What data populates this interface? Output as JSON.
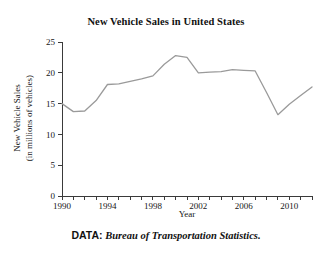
{
  "figure": {
    "title": "New Vehicle Sales in United States",
    "source_label": "DATA:",
    "source_value": "Bureau of Transportation Statistics."
  },
  "chart_data": {
    "type": "line",
    "title": "New Vehicle Sales in United States",
    "xlabel": "Year",
    "ylabel": "New Vehicle Sales (in millions of vehicles)",
    "ylabel_line1": "New Vehicle Sales",
    "ylabel_line2": "(in millions of vehicles)",
    "xlim": [
      1990,
      2012
    ],
    "ylim": [
      0,
      25
    ],
    "grid": false,
    "legend": "none",
    "line_color": "#9a9a9a",
    "axis_color": "#3a3a3a",
    "x_tick_labels": [
      "1990",
      "1994",
      "1998",
      "2002",
      "2006",
      "2010"
    ],
    "x_tick_label_values": [
      1990,
      1994,
      1998,
      2002,
      2006,
      2010
    ],
    "x_minor_ticks": [
      1990,
      1991,
      1992,
      1993,
      1994,
      1995,
      1996,
      1997,
      1998,
      1999,
      2000,
      2001,
      2002,
      2003,
      2004,
      2005,
      2006,
      2007,
      2008,
      2009,
      2010,
      2011,
      2012
    ],
    "y_tick_labels": [
      "0",
      "5",
      "10",
      "15",
      "20",
      "25"
    ],
    "y_tick_values": [
      0,
      5,
      10,
      15,
      20,
      25
    ],
    "x": [
      1990,
      1991,
      1992,
      1993,
      1994,
      1995,
      1996,
      1997,
      1998,
      1999,
      2000,
      2001,
      2002,
      2003,
      2004,
      2005,
      2006,
      2007,
      2008,
      2009,
      2010,
      2011,
      2012
    ],
    "values": [
      15.0,
      13.7,
      13.8,
      15.5,
      18.1,
      18.2,
      18.6,
      19.0,
      19.5,
      21.4,
      22.8,
      22.5,
      20.0,
      20.1,
      20.2,
      20.5,
      20.4,
      20.3,
      16.8,
      13.2,
      14.9,
      16.3,
      17.7
    ],
    "series": [
      {
        "name": "New Vehicle Sales",
        "values": [
          15.0,
          13.7,
          13.8,
          15.5,
          18.1,
          18.2,
          18.6,
          19.0,
          19.5,
          21.4,
          22.8,
          22.5,
          20.0,
          20.1,
          20.2,
          20.5,
          20.4,
          20.3,
          16.8,
          13.2,
          14.9,
          16.3,
          17.7
        ]
      }
    ]
  }
}
